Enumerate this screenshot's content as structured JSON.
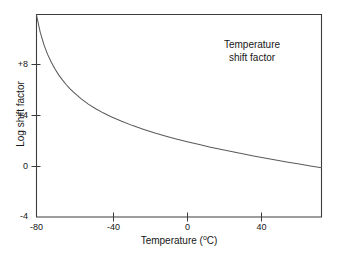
{
  "chart_data": {
    "type": "line",
    "title": "",
    "annotation": {
      "line1": "Temperature",
      "line2": "shift factor"
    },
    "xlabel": "Temperature (°C)",
    "ylabel": "Log shift factor",
    "xlim": [
      -80,
      74
    ],
    "ylim": [
      -4,
      12
    ],
    "xticks": [
      -80,
      -40,
      0,
      40
    ],
    "xtick_labels": [
      "-80",
      "-40",
      "0",
      "40"
    ],
    "yticks": [
      -4,
      0,
      4,
      8
    ],
    "ytick_labels": [
      "-4",
      "0",
      "+4",
      "+8"
    ],
    "grid": false,
    "legend": null,
    "series": [
      {
        "name": "Log shift factor",
        "x": [
          -80,
          -78,
          -76,
          -74,
          -72,
          -70,
          -68,
          -66,
          -64,
          -62,
          -60,
          -56,
          -52,
          -48,
          -44,
          -40,
          -34,
          -28,
          -22,
          -16,
          -10,
          -4,
          2,
          8,
          14,
          20,
          26,
          32,
          38,
          44,
          50,
          56,
          62,
          68,
          74
        ],
        "y": [
          11.95,
          10.6,
          9.62,
          8.85,
          8.22,
          7.69,
          7.23,
          6.83,
          6.47,
          6.15,
          5.86,
          5.35,
          4.92,
          4.55,
          4.23,
          3.94,
          3.56,
          3.22,
          2.92,
          2.64,
          2.39,
          2.15,
          1.93,
          1.72,
          1.52,
          1.33,
          1.15,
          0.97,
          0.8,
          0.64,
          0.48,
          0.33,
          0.18,
          0.03,
          -0.11
        ]
      }
    ],
    "line_color": "#5a5a5a",
    "axis_color": "#3c3c3c",
    "background_color": "#ffffff"
  },
  "axes": {
    "y_ticks": [
      {
        "label": "+8"
      },
      {
        "label": "+4"
      },
      {
        "label": "0"
      },
      {
        "label": "-4"
      }
    ],
    "x_ticks": [
      {
        "label": "-80"
      },
      {
        "label": "-40"
      },
      {
        "label": "0"
      },
      {
        "label": "40"
      }
    ],
    "x_title_text": "Temperature (",
    "x_title_degree": "o",
    "x_title_unit": "C)",
    "y_title": "Log shift factor"
  }
}
